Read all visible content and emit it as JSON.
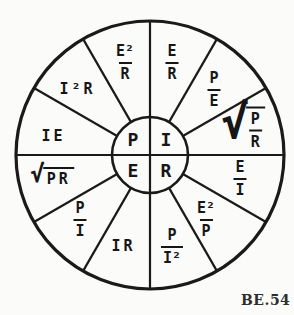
{
  "figure_label": "BE.54",
  "symbols": {
    "radical": "√"
  },
  "wheel": {
    "center_quantities": [
      {
        "label": "P",
        "position": "top-left"
      },
      {
        "label": "I",
        "position": "top-right"
      },
      {
        "label": "E",
        "position": "bottom-left"
      },
      {
        "label": "R",
        "position": "bottom-right"
      }
    ],
    "sectors": [
      {
        "for": "I",
        "type": "fraction",
        "num": "E",
        "den": "R"
      },
      {
        "for": "I",
        "type": "fraction",
        "num": "P",
        "den": "E"
      },
      {
        "for": "I",
        "type": "sqrt-fraction",
        "num": "P",
        "den": "R"
      },
      {
        "for": "R",
        "type": "fraction",
        "num": "E",
        "den": "I"
      },
      {
        "for": "R",
        "type": "fraction",
        "num": "E²",
        "den": "P"
      },
      {
        "for": "R",
        "type": "fraction",
        "num": "P",
        "den": "I²"
      },
      {
        "for": "E",
        "type": "product",
        "text": "IR"
      },
      {
        "for": "E",
        "type": "fraction",
        "num": "P",
        "den": "I"
      },
      {
        "for": "E",
        "type": "sqrt-product",
        "text": "PR"
      },
      {
        "for": "P",
        "type": "product",
        "text": "IE"
      },
      {
        "for": "P",
        "type": "product",
        "text": "I²R"
      },
      {
        "for": "P",
        "type": "fraction",
        "num": "E²",
        "den": "R"
      }
    ]
  }
}
